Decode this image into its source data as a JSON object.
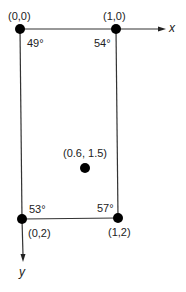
{
  "diagram": {
    "type": "coordinate-grid",
    "axes": {
      "x_label": "x",
      "y_label": "y"
    },
    "points": [
      {
        "coord": "(0,0)",
        "temperature": "49°"
      },
      {
        "coord": "(1,0)",
        "temperature": "54°"
      },
      {
        "coord": "(0,2)",
        "temperature": "53°"
      },
      {
        "coord": "(1,2)",
        "temperature": "57°"
      }
    ],
    "interior_point": {
      "coord": "(0.6, 1.5)"
    }
  }
}
